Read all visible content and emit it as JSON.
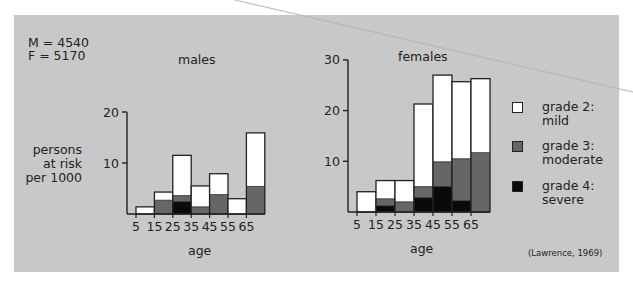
{
  "stats": {
    "line1": "M = 4540",
    "line2": "F = 5170"
  },
  "y_axis_label": {
    "line1": "persons",
    "line2": "at risk",
    "line3": "per 1000"
  },
  "x_axis_label": "age",
  "citation": "(Lawrence, 1969)",
  "colors": {
    "panel": "#c8c8c8",
    "mild": "#ffffff",
    "moderate": "#666666",
    "severe": "#0a0a0a",
    "outline": "#222222"
  },
  "legend": [
    {
      "key": "mild",
      "line1": "grade 2:",
      "line2": "mild",
      "color": "#ffffff"
    },
    {
      "key": "moderate",
      "line1": "grade 3:",
      "line2": "moderate",
      "color": "#666666"
    },
    {
      "key": "severe",
      "line1": "grade 4:",
      "line2": "severe",
      "color": "#0a0a0a"
    }
  ],
  "chart_data": [
    {
      "type": "bar",
      "stacked": true,
      "title": "males",
      "xlabel": "age",
      "ylabel": "persons at risk per 1000",
      "categories": [
        "5-15",
        "15-25",
        "25-35",
        "35-45",
        "45-55",
        "55-65",
        "65+"
      ],
      "x_tick_labels": [
        "5",
        "15",
        "25",
        "35",
        "45",
        "55",
        "65"
      ],
      "y_ticks": [
        10,
        20
      ],
      "ylim": [
        0,
        20
      ],
      "series": [
        {
          "name": "grade 4: severe",
          "values": [
            0,
            0,
            2.4,
            0,
            0,
            0,
            0
          ]
        },
        {
          "name": "grade 3: moderate",
          "values": [
            0,
            2.7,
            1.2,
            1.4,
            3.8,
            0,
            5.4
          ]
        },
        {
          "name": "grade 2: mild",
          "values": [
            1.4,
            1.6,
            7.9,
            4.1,
            4.1,
            3.0,
            10.5
          ]
        }
      ],
      "totals": [
        1.4,
        4.3,
        11.5,
        5.5,
        7.9,
        3.0,
        15.9
      ]
    },
    {
      "type": "bar",
      "stacked": true,
      "title": "females",
      "xlabel": "age",
      "ylabel": "persons at risk per 1000",
      "categories": [
        "5-15",
        "15-25",
        "25-35",
        "35-45",
        "45-55",
        "55-65",
        "65+"
      ],
      "x_tick_labels": [
        "5",
        "15",
        "25",
        "35",
        "45",
        "55",
        "65"
      ],
      "y_ticks": [
        10,
        20,
        30
      ],
      "ylim": [
        0,
        30
      ],
      "series": [
        {
          "name": "grade 4: severe",
          "values": [
            0,
            1.2,
            0,
            2.8,
            5.0,
            2.2,
            0
          ]
        },
        {
          "name": "grade 3: moderate",
          "values": [
            0,
            1.4,
            2.0,
            2.2,
            4.9,
            8.3,
            11.7
          ]
        },
        {
          "name": "grade 2: mild",
          "values": [
            4.0,
            3.6,
            4.2,
            16.3,
            17.1,
            15.2,
            14.6
          ]
        }
      ],
      "totals": [
        4.0,
        6.2,
        6.2,
        21.3,
        27.0,
        25.7,
        26.3
      ]
    }
  ]
}
